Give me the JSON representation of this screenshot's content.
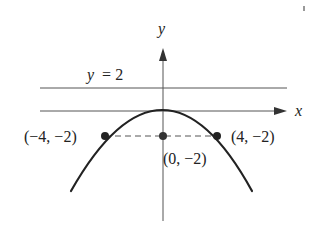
{
  "diagram": {
    "axes": {
      "x_label": "x",
      "y_label": "y"
    },
    "directrix": {
      "label": "y = 2",
      "label_var": "y",
      "label_rest": "= 2",
      "value": 2
    },
    "parabola": {
      "equation": "x^2 = -8y",
      "vertex": [
        0,
        0
      ],
      "opens": "down"
    },
    "points": [
      {
        "label": "(−4, −2)",
        "x": -4,
        "y": -2
      },
      {
        "label": "(0, −2)",
        "x": 0,
        "y": -2
      },
      {
        "label": "(4, −2)",
        "x": 4,
        "y": -2
      }
    ],
    "latus_rectum": {
      "style": "dashed",
      "from": [
        -4,
        -2
      ],
      "to": [
        4,
        -2
      ]
    },
    "colors": {
      "ink": "#222222",
      "background": "#ffffff"
    }
  }
}
